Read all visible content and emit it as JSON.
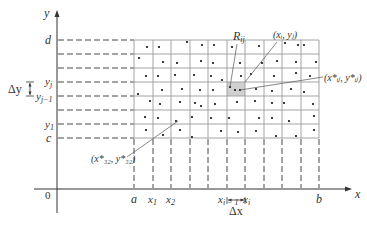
{
  "figure": {
    "axes": {
      "x_label": "x",
      "y_label": "y",
      "origin_label": "0"
    },
    "x_ticks": [
      {
        "label": "a",
        "pos": 134
      },
      {
        "label": "x",
        "sub": "1",
        "pos": 153
      },
      {
        "label": "x",
        "sub": "2",
        "pos": 171
      },
      {
        "label": "x",
        "sub": "i − 1",
        "pos": 227
      },
      {
        "label": "x",
        "sub": "i",
        "pos": 245
      },
      {
        "label": "b",
        "pos": 319
      }
    ],
    "y_ticks": [
      {
        "label": "d",
        "pos": 40
      },
      {
        "label": "y",
        "sub": "j",
        "pos": 82
      },
      {
        "label": "y",
        "sub": "j−1",
        "pos": 96
      },
      {
        "label": "y",
        "sub": "1",
        "pos": 124
      },
      {
        "label": "c",
        "pos": 138
      }
    ],
    "delta_x_label": "Δx",
    "delta_y_label": "Δy",
    "annotations": {
      "rij": "R",
      "rij_sub": "ij",
      "corner_point": "(x",
      "corner_point_text": "(xᵢ, yⱼ)",
      "sample_point_text": "(x*ᵢⱼ, y*ᵢⱼ)",
      "sample_32_text": "(x*₃₂, y*₃₂)"
    },
    "grid": {
      "x_lines": [
        134,
        153,
        171,
        190,
        208,
        227,
        245,
        264,
        282,
        301,
        319
      ],
      "y_lines": [
        40,
        54,
        68,
        82,
        96,
        110,
        124,
        138
      ],
      "shaded_cell": {
        "x0": 227,
        "x1": 245,
        "y0": 82,
        "y1": 96
      },
      "shade_color": "#d0d0d0",
      "line_color": "#9a9a9a"
    }
  }
}
